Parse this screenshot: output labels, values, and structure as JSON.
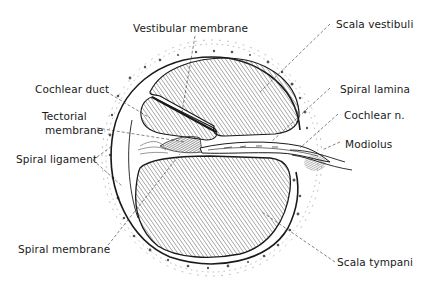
{
  "diagram": {
    "colors": {
      "ink": "#1a1a1a",
      "hatch": "#4a4a4a",
      "background": "#ffffff",
      "leader": "#333333"
    },
    "labels": [
      {
        "id": "vestibular-membrane",
        "text": "Vestibular membrane"
      },
      {
        "id": "scala-vestibuli",
        "text": "Scala vestibuli"
      },
      {
        "id": "cochlear-duct",
        "text": "Cochlear duct"
      },
      {
        "id": "spiral-lamina",
        "text": "Spiral lamina"
      },
      {
        "id": "tectorial-membrane-1",
        "text": "Tectorial"
      },
      {
        "id": "tectorial-membrane-2",
        "text": "membrane"
      },
      {
        "id": "cochlear-n",
        "text": "Cochlear n."
      },
      {
        "id": "modiolus",
        "text": "Modiolus"
      },
      {
        "id": "spiral-ligament",
        "text": "Spiral ligament"
      },
      {
        "id": "spiral-membrane",
        "text": "Spiral membrane"
      },
      {
        "id": "scala-tympani",
        "text": "Scala tympani"
      }
    ]
  }
}
